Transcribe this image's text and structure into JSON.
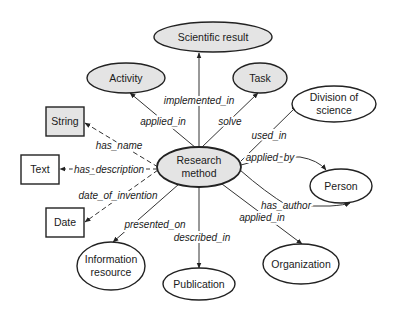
{
  "colors": {
    "concept_fill": "#e4e4e4",
    "plain_fill": "#ffffff",
    "stroke": "#222222",
    "text": "#1a1a1a"
  },
  "nodes": {
    "scientific_result": {
      "label": "Scientific result",
      "shape": "ellipse",
      "filled": true
    },
    "activity": {
      "label": "Activity",
      "shape": "ellipse",
      "filled": true
    },
    "task": {
      "label": "Task",
      "shape": "ellipse",
      "filled": true
    },
    "division_of_science": {
      "line1": "Division of",
      "line2": "science",
      "shape": "ellipse",
      "filled": false
    },
    "string": {
      "label": "String",
      "shape": "rectangle",
      "filled": true
    },
    "text": {
      "label": "Text",
      "shape": "rectangle",
      "filled": false
    },
    "date": {
      "label": "Date",
      "shape": "rectangle",
      "filled": false
    },
    "research_method": {
      "line1": "Research",
      "line2": "method",
      "shape": "ellipse",
      "filled": true
    },
    "person": {
      "label": "Person",
      "shape": "ellipse",
      "filled": false
    },
    "information_resource": {
      "line1": "Information",
      "line2": "resource",
      "shape": "ellipse",
      "filled": false
    },
    "publication": {
      "label": "Publication",
      "shape": "ellipse",
      "filled": false
    },
    "organization": {
      "label": "Organization",
      "shape": "ellipse",
      "filled": false
    }
  },
  "edges": {
    "implemented_in": {
      "label": "implemented_in",
      "from": "Research method",
      "to": "Scientific result",
      "style": "solid"
    },
    "applied_in_activity": {
      "label": "applied_in",
      "from": "Research method",
      "to": "Activity",
      "style": "solid"
    },
    "solve": {
      "label": "solve",
      "from": "Research method",
      "to": "Task",
      "style": "solid"
    },
    "used_in": {
      "label": "used_in",
      "from": "Research method",
      "to": "Division of science",
      "style": "solid"
    },
    "has_name": {
      "label": "has_name",
      "from": "Research method",
      "to": "String",
      "style": "dashed"
    },
    "has_description": {
      "label": "has_description",
      "from": "Research method",
      "to": "Text",
      "style": "dashed"
    },
    "date_of_invention": {
      "label": "date_of_invention",
      "from": "Research method",
      "to": "Date",
      "style": "dashed"
    },
    "applied_by": {
      "label": "applied_by",
      "from": "Research method",
      "to": "Person",
      "style": "solid"
    },
    "has_author": {
      "label": "has_author",
      "from": "Research method",
      "to": "Person",
      "style": "solid"
    },
    "presented_on": {
      "label": "presented_on",
      "from": "Research method",
      "to": "Information resource",
      "style": "solid"
    },
    "described_in": {
      "label": "described_in",
      "from": "Research method",
      "to": "Publication",
      "style": "solid"
    },
    "applied_in_organization": {
      "label": "applied_in",
      "from": "Research method",
      "to": "Organization",
      "style": "solid"
    }
  }
}
